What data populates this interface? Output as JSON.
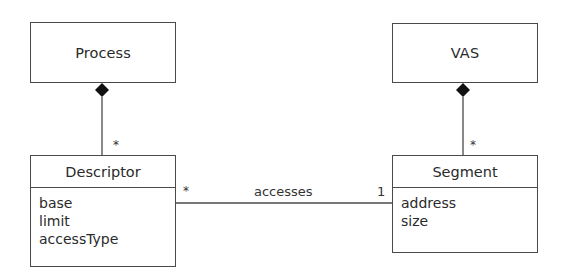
{
  "diagram": {
    "type": "UML class diagram",
    "classes": {
      "process": {
        "name": "Process"
      },
      "vas": {
        "name": "VAS"
      },
      "descriptor": {
        "name": "Descriptor",
        "attributes": [
          "base",
          "limit",
          "accessType"
        ]
      },
      "segment": {
        "name": "Segment",
        "attributes": [
          "address",
          "size"
        ]
      }
    },
    "relationships": [
      {
        "kind": "composition",
        "whole": "Process",
        "part": "Descriptor",
        "part_multiplicity": "*"
      },
      {
        "kind": "composition",
        "whole": "VAS",
        "part": "Segment",
        "part_multiplicity": "*"
      },
      {
        "kind": "association",
        "label": "accesses",
        "from": "Descriptor",
        "from_multiplicity": "*",
        "to": "Segment",
        "to_multiplicity": "1"
      }
    ],
    "labels": {
      "process_descriptor_mult": "*",
      "vas_segment_mult": "*",
      "assoc_label": "accesses",
      "assoc_from_mult": "*",
      "assoc_to_mult": "1"
    },
    "colors": {
      "stroke": "#4a4a4a",
      "text": "#2a2a2a",
      "background": "#ffffff"
    }
  }
}
